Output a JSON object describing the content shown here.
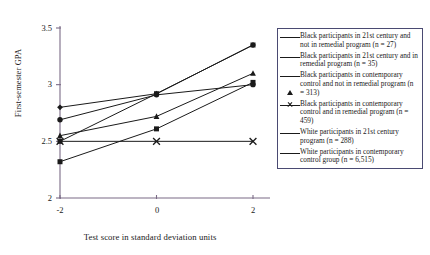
{
  "chart_data": {
    "type": "line",
    "title": "",
    "xlabel": "Test score in standard deviation units",
    "ylabel": "First-semester GPA",
    "x": [
      -2,
      0,
      2
    ],
    "xticklabels": [
      "-2",
      "0",
      "2"
    ],
    "yticklabels": [
      "2",
      "2.5",
      "3",
      "3.5"
    ],
    "yticks": [
      2,
      2.5,
      3,
      3.5
    ],
    "xlim": [
      -2.6,
      2.6
    ],
    "ylim": [
      2,
      3.5
    ],
    "grid": false,
    "legend_position": "right",
    "series": [
      {
        "name": "Black participants in 21st century and not in remedial program (n = 27)",
        "marker": "diamond",
        "values": [
          2.8,
          2.92,
          3.35
        ]
      },
      {
        "name": "Black participants in 21st century and in remedial program (n = 35)",
        "marker": "square",
        "values": [
          2.32,
          2.61,
          3.02
        ]
      },
      {
        "name": "Black participants in contemporary control and not in remedial program (n = 313)",
        "marker": "triangle",
        "values": [
          2.55,
          2.72,
          3.1
        ]
      },
      {
        "name": "Black participants in contemporary control and in remedial program (n = 459)",
        "marker": "cross",
        "values": [
          2.5,
          2.5,
          2.5
        ]
      },
      {
        "name": "White participants in 21st century program (n = 288)",
        "marker": "square",
        "values": [
          2.5,
          2.92,
          3.35
        ]
      },
      {
        "name": "White participants in contemporary control group (n = 6,515)",
        "marker": "circle",
        "values": [
          2.69,
          2.91,
          3.0
        ]
      }
    ]
  },
  "legend": {
    "items": [
      {
        "marker": "diamond",
        "label": "Black participants in 21st century and not in remedial program (n = 27)"
      },
      {
        "marker": "square",
        "label": "Black participants in 21st century and in remedial program (n = 35)"
      },
      {
        "marker": "triangle",
        "label": "Black participants in contemporary control and not in remedial program (n = 313)"
      },
      {
        "marker": "cross",
        "label": "Black participants in contemporary control and in remedial program (n = 459)"
      },
      {
        "marker": "square",
        "label": "White participants in 21st century program (n = 288)"
      },
      {
        "marker": "circle",
        "label": "White participants in contemporary control group (n = 6,515)"
      }
    ]
  },
  "colors": {
    "line": "#1a1a1a",
    "axis": "#7a6b86",
    "legend_border": "#4a4a72",
    "background": "#ffffff"
  }
}
